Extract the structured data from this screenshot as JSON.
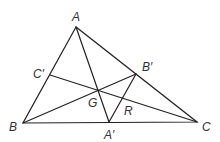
{
  "diagram": {
    "colors": {
      "line": "#222222",
      "label": "#333333",
      "background": "#ffffff"
    },
    "points": {
      "A": {
        "label": "A",
        "x": 76,
        "y": 27
      },
      "B": {
        "label": "B",
        "x": 23,
        "y": 123
      },
      "C": {
        "label": "C",
        "x": 197,
        "y": 122
      },
      "A_prime": {
        "label": "A′",
        "x": 109,
        "y": 122
      },
      "B_prime": {
        "label": "B′",
        "x": 136,
        "y": 74
      },
      "C_prime": {
        "label": "C′",
        "x": 50,
        "y": 75
      },
      "G": {
        "label": "G",
        "x": 99,
        "y": 89
      }
    },
    "region_labels": {
      "R": {
        "label": "R"
      }
    },
    "segments": [
      [
        "A",
        "B"
      ],
      [
        "B",
        "C"
      ],
      [
        "C",
        "A"
      ],
      [
        "A",
        "A_prime"
      ],
      [
        "B",
        "B_prime"
      ],
      [
        "C",
        "C_prime"
      ],
      [
        "A_prime",
        "B_prime"
      ]
    ]
  }
}
